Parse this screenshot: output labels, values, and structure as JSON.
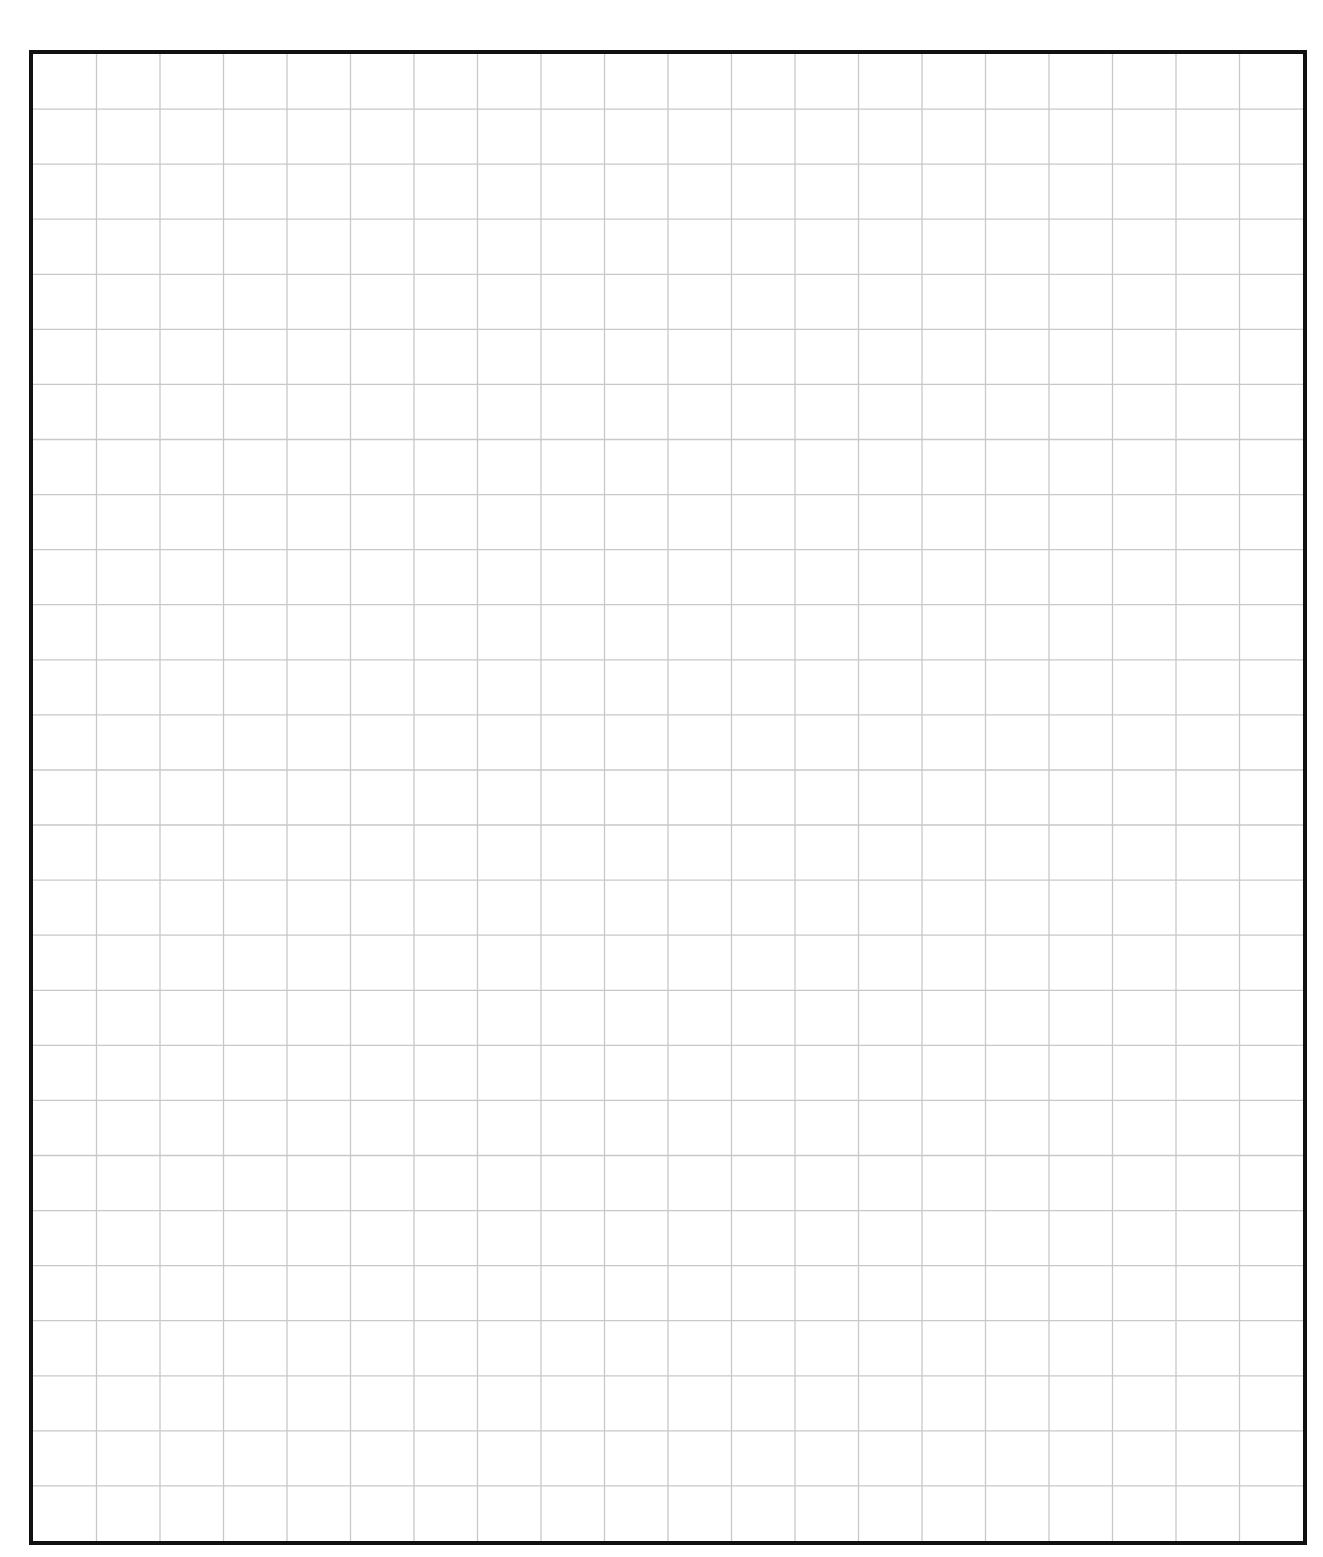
{
  "page": {
    "heading_fragment": "",
    "heading_note": "Top text is cut off; only descenders visible"
  },
  "grid": {
    "columns": 20,
    "rows": 27,
    "line_color": "#c8c8c8",
    "border_color": "#111111"
  }
}
